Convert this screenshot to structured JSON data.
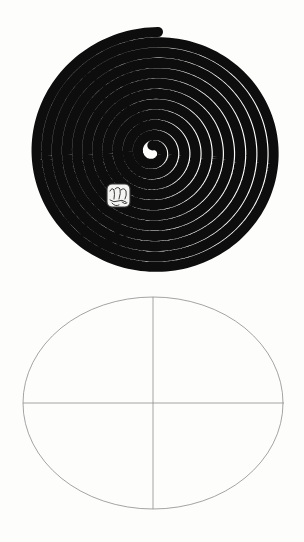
{
  "page": {
    "background_color": "#fdfdfc",
    "width": 304,
    "height": 542
  },
  "figures": [
    {
      "id": "spiral",
      "name": "Concentric black-and-white spiral disc",
      "caption": "",
      "ink_color": "#0d0d0d",
      "paper_color": "#fdfdfc",
      "center": {
        "x": 152,
        "y": 152
      },
      "bounds": {
        "left": 28,
        "top": 33,
        "right": 277,
        "bottom": 272
      },
      "radius_x": 124,
      "radius_y": 120,
      "turns": 11,
      "stroke_width": 10,
      "center_mark": {
        "name": "handwritten-scribble",
        "text": "",
        "bounds": {
          "left": 105,
          "top": 182,
          "width": 28,
          "height": 28
        },
        "color": "#3a3a3a"
      }
    },
    {
      "id": "ellipse",
      "name": "Outlined ellipse with crosshair axes",
      "caption": "",
      "ink_color": "#8d8d8d",
      "paper_color": "#fdfdfc",
      "center": {
        "x": 153,
        "y": 403
      },
      "bounds": {
        "left": 23,
        "top": 297,
        "right": 284,
        "bottom": 509
      },
      "radius_x": 130,
      "radius_y": 106,
      "stroke_width": 0.8,
      "axes": {
        "vertical": {
          "x": 153,
          "y1": 297,
          "y2": 509
        },
        "horizontal": {
          "y": 403,
          "x1": 23,
          "x2": 284
        }
      }
    }
  ],
  "chart_data": {
    "type": "line",
    "xlabel": "",
    "ylabel": "",
    "grid": false,
    "legend": "none",
    "series": [
      {
        "name": "spiral",
        "kind": "archimedean-spiral",
        "turns": 11,
        "center": [
          152,
          152
        ],
        "r_max_x": 124,
        "r_max_y": 120,
        "stroke": "#0d0d0d",
        "stroke_width": 10
      },
      {
        "name": "ellipse-outline",
        "kind": "ellipse",
        "center": [
          153,
          403
        ],
        "rx": 130,
        "ry": 106,
        "stroke": "#8d8d8d",
        "stroke_width": 0.8
      },
      {
        "name": "vertical-axis",
        "kind": "segment",
        "points": [
          [
            153,
            297
          ],
          [
            153,
            509
          ]
        ],
        "stroke": "#8d8d8d",
        "stroke_width": 0.8
      },
      {
        "name": "horizontal-axis",
        "kind": "segment",
        "points": [
          [
            23,
            403
          ],
          [
            284,
            403
          ]
        ],
        "stroke": "#8d8d8d",
        "stroke_width": 0.8
      }
    ]
  }
}
